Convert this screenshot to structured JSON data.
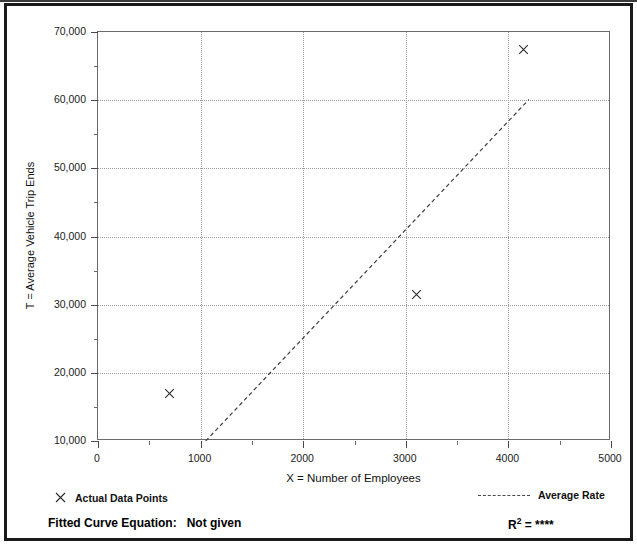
{
  "chart_data": {
    "type": "scatter",
    "title": "",
    "xlabel": "X = Number of Employees",
    "ylabel": "T = Average Vehicle Trip Ends",
    "xlim": [
      0,
      5000
    ],
    "ylim": [
      10000,
      70000
    ],
    "grid": true,
    "x_ticks": [
      "0",
      "1000",
      "2000",
      "3000",
      "4000",
      "5000"
    ],
    "x_tick_values": [
      0,
      1000,
      2000,
      3000,
      4000,
      5000
    ],
    "x_minor_tick_values": [
      500,
      1500,
      2500,
      3500,
      4500
    ],
    "y_ticks": [
      "10,000",
      "20,000",
      "30,000",
      "40,000",
      "50,000",
      "60,000",
      "70,000"
    ],
    "y_tick_values": [
      10000,
      20000,
      30000,
      40000,
      50000,
      60000,
      70000
    ],
    "y_minor_tick_values": [
      15000,
      25000,
      35000,
      45000,
      55000,
      65000
    ],
    "series": [
      {
        "name": "Actual Data Points",
        "type": "scatter",
        "marker": "x",
        "points": [
          {
            "x": 700,
            "y": 17000
          },
          {
            "x": 3100,
            "y": 31500
          },
          {
            "x": 4150,
            "y": 67500
          }
        ]
      },
      {
        "name": "Average Rate",
        "type": "line",
        "style": "dashed",
        "points": [
          {
            "x": 1050,
            "y": 10000
          },
          {
            "x": 4200,
            "y": 60100
          }
        ]
      }
    ],
    "legend_position": "below-plot"
  },
  "legend": {
    "actual_points_label": "Actual Data Points",
    "actual_points_marker": "x-marker-icon",
    "average_rate_label": "Average Rate",
    "average_rate_marker": "dashed-line-icon"
  },
  "footer": {
    "equation_label": "Fitted Curve Equation:",
    "equation_value": "Not given",
    "r2_label": "R",
    "r2_exponent": "2",
    "r2_equals": "=",
    "r2_value": "****"
  },
  "axis": {
    "y_title": "T = Average Vehicle Trip Ends",
    "x_title": "X = Number of Employees"
  }
}
